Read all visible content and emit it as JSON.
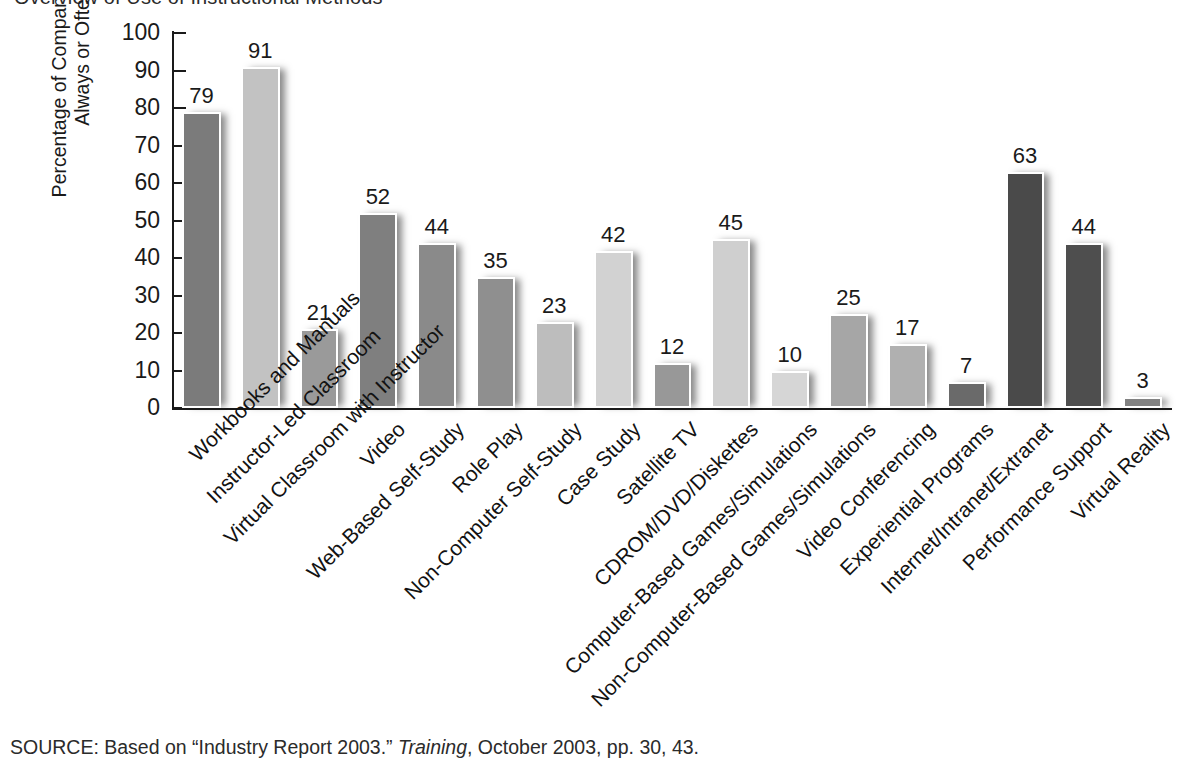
{
  "chart_data": {
    "type": "bar",
    "title": "Overview of Use of Instructional Methods",
    "xlabel": "",
    "ylabel": "Percentage of Companies Using Always or Often",
    "ylabel_line1": "Percentage of Companies Using",
    "ylabel_line2": "Always or Often",
    "ylim": [
      0,
      100
    ],
    "ytick_step": 10,
    "yticks": [
      100,
      90,
      80,
      70,
      60,
      50,
      40,
      30,
      20,
      10,
      0
    ],
    "grid": false,
    "legend": "none",
    "categories": [
      "Workbooks and Manuals",
      "Instructor-Led Classroom",
      "Virtual Classroom with Instructor",
      "Video",
      "Web-Based Self-Study",
      "Role Play",
      "Non-Computer Self-Study",
      "Case Study",
      "Satellite TV",
      "CDROM/DVD/Diskettes",
      "Computer-Based Games/Simulations",
      "Non-Computer-Based Games/Simulations",
      "Video Conferencing",
      "Experiential Programs",
      "Internet/Intranet/Extranet",
      "Performance Support",
      "Virtual Reality"
    ],
    "values": [
      79,
      91,
      21,
      52,
      44,
      35,
      23,
      42,
      12,
      45,
      10,
      25,
      17,
      7,
      63,
      44,
      3
    ],
    "bar_colors": [
      "#7b7b7b",
      "#c2c2c2",
      "#9a9a9a",
      "#7f7f7f",
      "#8a8a8a",
      "#8f8f8f",
      "#bdbdbd",
      "#d2d2d2",
      "#989898",
      "#cfcfcf",
      "#d6d6d6",
      "#a6a6a6",
      "#b0b0b0",
      "#6a6a6a",
      "#4a4a4a",
      "#4e4e4e",
      "#828282"
    ],
    "bar_edge_color": "#ffffff",
    "axis_color": "#1a1a1a",
    "background_color": "#ffffff",
    "data_labels": [
      "79",
      "91",
      "21",
      "52",
      "44",
      "35",
      "23",
      "42",
      "12",
      "45",
      "10",
      "25",
      "17",
      "7",
      "63",
      "44",
      "3"
    ]
  },
  "source": {
    "prefix": "SOURCE: Based on “Industry Report 2003.” ",
    "italic": "Training",
    "suffix": ", October 2003, pp. 30, 43."
  }
}
